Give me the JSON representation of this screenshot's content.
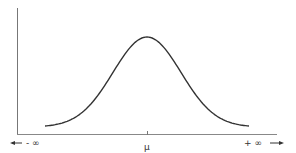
{
  "chart_data": {
    "type": "line",
    "title": "",
    "xlabel": "",
    "ylabel": "",
    "x_tick_labels": [
      "μ"
    ],
    "annotations": {
      "left_end": "- ∞",
      "right_end": "+ ∞",
      "center": "μ"
    },
    "x": [
      -3,
      -2.5,
      -2,
      -1.5,
      -1,
      -0.5,
      0,
      0.5,
      1,
      1.5,
      2,
      2.5,
      3
    ],
    "series": [
      {
        "name": "density",
        "values": [
          0.004,
          0.018,
          0.054,
          0.13,
          0.242,
          0.352,
          0.399,
          0.352,
          0.242,
          0.13,
          0.054,
          0.018,
          0.004
        ]
      }
    ],
    "grid": false,
    "legend": "none",
    "colors": {
      "curve": "#333333",
      "axis": "#777777"
    }
  },
  "labels": {
    "mu": "μ",
    "left": "- ∞",
    "right": "+ ∞"
  }
}
